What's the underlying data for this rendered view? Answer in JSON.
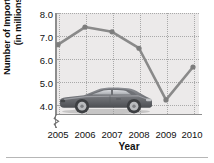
{
  "chart_data": {
    "type": "line",
    "title": "",
    "xlabel": "Year",
    "ylabel": "Number of Imported Cars\n(in millions)",
    "ylabel_line1": "Number of Imported Cars",
    "ylabel_line2": "(in millions)",
    "categories": [
      "2005",
      "2006",
      "2007",
      "2008",
      "2009",
      "2010"
    ],
    "x": [
      2005,
      2006,
      2007,
      2008,
      2009,
      2010
    ],
    "values": [
      6.65,
      7.4,
      7.2,
      6.5,
      4.3,
      5.7
    ],
    "series": [
      {
        "name": "Number of Imported Cars",
        "values": [
          6.65,
          7.4,
          7.2,
          6.5,
          4.3,
          5.7
        ]
      }
    ],
    "ylim": [
      3.7,
      8.0
    ],
    "yticks": [
      "4.0",
      "5.0",
      "6.0",
      "7.0",
      "8.0"
    ],
    "ytick_values": [
      4.0,
      5.0,
      6.0,
      7.0,
      8.0
    ],
    "xticks": [
      "2005",
      "2006",
      "2007",
      "2008",
      "2009",
      "2010"
    ],
    "grid": true,
    "grid_style": "dotted",
    "legend": "none",
    "axis_break": true,
    "axis_break_axis": "y",
    "line_color": "#8a8a8a",
    "marker_color": "#7d7d7d",
    "plot_background": "#eceaea",
    "axis_color": "#8d8d8d",
    "grid_color": "#a9a9a9",
    "text_color": "#111111",
    "annotations": [
      {
        "name": "sports-car-illustration",
        "description": "grey sports car clip art overlaying lower-left plot area"
      }
    ]
  },
  "figure": {
    "background": "#ffffff",
    "rule_color": "#b6b6b6"
  }
}
